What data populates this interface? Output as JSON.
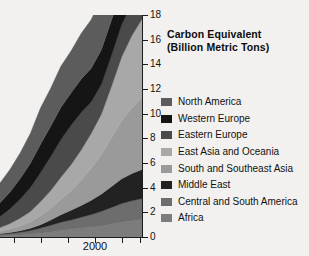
{
  "chart_data": {
    "type": "area",
    "stacked": true,
    "title": "Carbon Equivalent (Billion Metric Tons)",
    "title_lines": [
      "Carbon Equivalent",
      "(Billion Metric Tons)"
    ],
    "xlabel": "",
    "ylabel": "",
    "ylim": [
      0,
      18
    ],
    "ytick_labels": [
      "0",
      "2",
      "4",
      "6",
      "8",
      "10",
      "12",
      "14",
      "16",
      "18"
    ],
    "ytick_values": [
      0,
      2,
      4,
      6,
      8,
      10,
      12,
      14,
      16,
      18
    ],
    "xtick_labels": [
      "",
      "",
      "",
      "2000",
      "",
      ""
    ],
    "xtick_positions": [
      14,
      41,
      68,
      95,
      122,
      140
    ],
    "grid": false,
    "legend_position": "right",
    "x": [
      1950,
      1955,
      1960,
      1965,
      1970,
      1975,
      1980,
      1985,
      1990,
      1995,
      2000,
      2005,
      2010,
      2015,
      2020
    ],
    "series": [
      {
        "name": "Africa",
        "color": "#7c7c7c",
        "values": [
          0.1,
          0.13,
          0.17,
          0.22,
          0.3,
          0.4,
          0.52,
          0.62,
          0.72,
          0.8,
          0.9,
          1.05,
          1.2,
          1.32,
          1.42
        ]
      },
      {
        "name": "Central and South America",
        "color": "#6d6d6d",
        "values": [
          0.12,
          0.16,
          0.22,
          0.3,
          0.42,
          0.55,
          0.68,
          0.76,
          0.88,
          1.02,
          1.18,
          1.35,
          1.52,
          1.62,
          1.7
        ]
      },
      {
        "name": "Middle East",
        "color": "#222222",
        "values": [
          0.05,
          0.08,
          0.12,
          0.18,
          0.28,
          0.42,
          0.6,
          0.78,
          0.95,
          1.15,
          1.4,
          1.7,
          2.0,
          2.2,
          2.35
        ]
      },
      {
        "name": "South and Southeast Asia",
        "color": "#9a9a9a",
        "values": [
          0.2,
          0.28,
          0.38,
          0.52,
          0.72,
          0.95,
          1.25,
          1.6,
          2.05,
          2.6,
          3.2,
          3.95,
          4.7,
          5.3,
          5.8
        ]
      },
      {
        "name": "East Asia and Oceania",
        "color": "#a8a8a8",
        "values": [
          0.3,
          0.45,
          0.65,
          0.85,
          1.15,
          1.45,
          1.8,
          2.1,
          2.45,
          2.85,
          3.3,
          4.2,
          5.2,
          5.9,
          6.4
        ]
      },
      {
        "name": "Eastern Europe",
        "color": "#4a4a4a",
        "values": [
          0.9,
          1.2,
          1.55,
          1.95,
          2.35,
          2.75,
          3.05,
          3.2,
          3.05,
          2.55,
          2.4,
          2.5,
          2.6,
          2.62,
          2.65
        ]
      },
      {
        "name": "Western Europe",
        "color": "#151515",
        "values": [
          1.1,
          1.35,
          1.65,
          1.95,
          2.3,
          2.45,
          2.6,
          2.62,
          2.7,
          2.72,
          2.8,
          2.85,
          2.8,
          2.7,
          2.62
        ]
      },
      {
        "name": "North America",
        "color": "#5c5c5c",
        "values": [
          1.6,
          1.85,
          2.1,
          2.45,
          2.95,
          3.1,
          3.35,
          3.4,
          3.7,
          3.95,
          4.25,
          4.45,
          4.35,
          4.2,
          4.1
        ]
      }
    ],
    "legend_entries": [
      {
        "label": "North America",
        "color": "#5c5c5c"
      },
      {
        "label": "Western Europe",
        "color": "#151515"
      },
      {
        "label": "Eastern Europe",
        "color": "#4a4a4a"
      },
      {
        "label": "East Asia and Oceania",
        "color": "#a8a8a8"
      },
      {
        "label": "South and Southeast Asia",
        "color": "#9a9a9a"
      },
      {
        "label": "Middle East",
        "color": "#222222"
      },
      {
        "label": "Central and South America",
        "color": "#6d6d6d"
      },
      {
        "label": "Africa",
        "color": "#7c7c7c"
      }
    ]
  }
}
